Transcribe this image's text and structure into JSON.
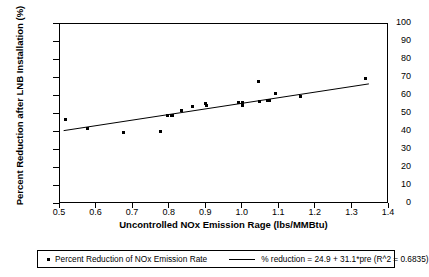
{
  "chart_data": {
    "type": "scatter",
    "title": "",
    "xlabel": "Uncontrolled NOx Emission Rage (lbs/MMBtu)",
    "ylabel": "Percent Reduction after LNB Installation (%)",
    "xlim": [
      0.5,
      1.4
    ],
    "ylim": [
      0,
      100
    ],
    "xticks": [
      0.5,
      0.6,
      0.7,
      0.8,
      0.9,
      1.0,
      1.1,
      1.2,
      1.3,
      1.4
    ],
    "xtick_labels": [
      "0.5",
      "0.6",
      "0.7",
      "0.8",
      "0.9",
      "1.0",
      "1.1",
      "1.2",
      "1.3",
      "1.4"
    ],
    "yticks": [
      0,
      10,
      20,
      30,
      40,
      50,
      60,
      70,
      80,
      90,
      100
    ],
    "ytick_labels": [
      "0",
      "10",
      "20",
      "30",
      "40",
      "50",
      "60",
      "70",
      "80",
      "90",
      "100"
    ],
    "grid": false,
    "legend_position": "below-plot",
    "series": [
      {
        "name": "Percent Reduction of NOx Emission Rate",
        "type": "scatter",
        "marker": "square",
        "color": "#000000",
        "points": [
          {
            "x": 0.515,
            "y": 47.0
          },
          {
            "x": 0.575,
            "y": 42.0
          },
          {
            "x": 0.675,
            "y": 40.0
          },
          {
            "x": 0.775,
            "y": 40.5
          },
          {
            "x": 0.795,
            "y": 49.2
          },
          {
            "x": 0.805,
            "y": 49.3
          },
          {
            "x": 0.808,
            "y": 49.0
          },
          {
            "x": 0.833,
            "y": 52.0
          },
          {
            "x": 0.862,
            "y": 54.0
          },
          {
            "x": 0.898,
            "y": 56.0
          },
          {
            "x": 0.9,
            "y": 54.5
          },
          {
            "x": 0.988,
            "y": 56.5
          },
          {
            "x": 0.998,
            "y": 56.4
          },
          {
            "x": 1.0,
            "y": 54.5
          },
          {
            "x": 1.043,
            "y": 68.0
          },
          {
            "x": 1.045,
            "y": 56.7
          },
          {
            "x": 1.068,
            "y": 57.6
          },
          {
            "x": 1.072,
            "y": 57.3
          },
          {
            "x": 1.09,
            "y": 61.5
          },
          {
            "x": 1.158,
            "y": 60.0
          },
          {
            "x": 1.335,
            "y": 70.0
          }
        ]
      },
      {
        "name": "% reduction = 24.9 + 31.1*pre (R^2 = 0.6835)",
        "type": "line",
        "color": "#000000",
        "equation": {
          "intercept": 24.9,
          "slope": 31.1,
          "r_squared": 0.6835
        },
        "x_start": 0.51,
        "x_end": 1.345
      }
    ]
  },
  "legend": {
    "entries": [
      {
        "label": "Percent Reduction of NOx Emission Rate",
        "marker": "square-dot"
      },
      {
        "label": "% reduction = 24.9 + 31.1*pre (R^2 = 0.6835)",
        "marker": "line"
      }
    ]
  }
}
